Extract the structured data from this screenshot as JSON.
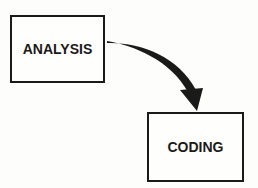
{
  "diagram": {
    "nodes": [
      {
        "id": "analysis",
        "label": "ANALYSIS"
      },
      {
        "id": "coding",
        "label": "CODING"
      }
    ],
    "edges": [
      {
        "from": "analysis",
        "to": "coding",
        "style": "curved-tapered-arrow"
      }
    ],
    "colors": {
      "stroke": "#1a1a1a",
      "background": "#fdfdfb"
    }
  }
}
